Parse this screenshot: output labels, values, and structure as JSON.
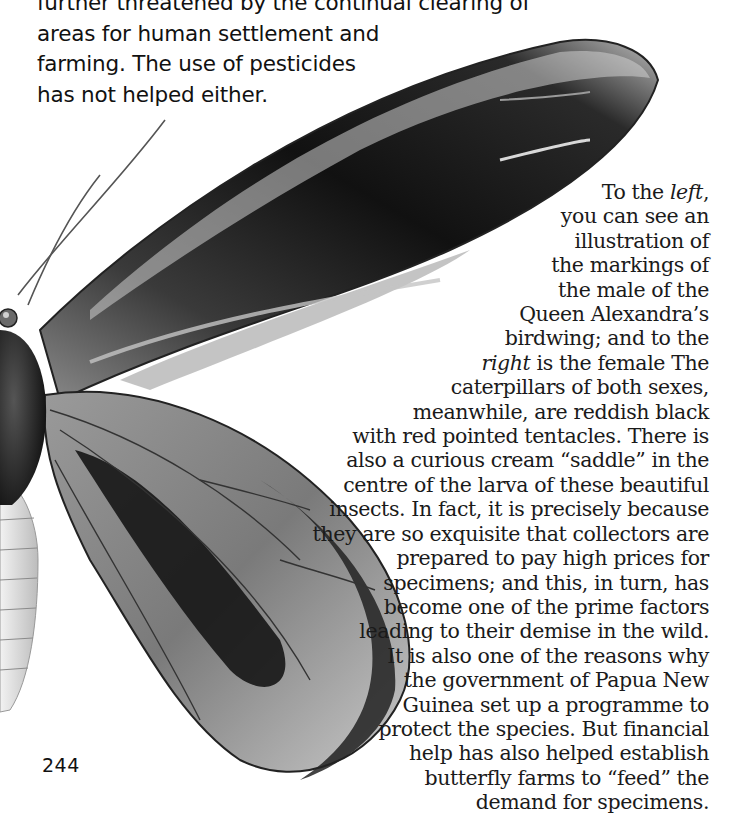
{
  "page": {
    "page_number": "244",
    "intro_paragraph": {
      "lines": [
        "further threatened by the continual clearing of",
        "areas for human settlement and",
        "farming. The use of pesticides",
        "has not helped either."
      ]
    },
    "illustration": {
      "subject": "Queen Alexandra's birdwing butterfly (male) — left wings, body and antennae",
      "style": "grayscale scanned drawing"
    },
    "body_paragraph": {
      "lines": [
        {
          "pre": "To the ",
          "em": "left",
          "post": ","
        },
        {
          "pre": "you can see an"
        },
        {
          "pre": "illustration of"
        },
        {
          "pre": "the markings of"
        },
        {
          "pre": "the male of the"
        },
        {
          "pre": "Queen Alexandra’s"
        },
        {
          "pre": "birdwing; and to the"
        },
        {
          "pre": "",
          "em": "right",
          "post": " is the female The"
        },
        {
          "pre": "caterpillars of both sexes,"
        },
        {
          "pre": "meanwhile, are reddish black"
        },
        {
          "pre": "with red pointed tentacles. There is"
        },
        {
          "pre": "also a curious cream “saddle” in the"
        },
        {
          "pre": "centre of the larva of these beautiful"
        },
        {
          "pre": "insects. In fact, it is precisely because"
        },
        {
          "pre": "they are so exquisite that collectors are"
        },
        {
          "pre": "prepared to pay high prices for"
        },
        {
          "pre": "specimens; and this, in turn, has"
        },
        {
          "pre": "become one of the prime factors"
        },
        {
          "pre": "leading to their demise in the wild."
        },
        {
          "pre": "It is also one of the reasons why"
        },
        {
          "pre": "the government of Papua New"
        },
        {
          "pre": "Guinea set up a programme to"
        },
        {
          "pre": "protect the species. But financial"
        },
        {
          "pre": "help has also helped establish"
        },
        {
          "pre": "butterfly farms to “feed” the"
        },
        {
          "pre": "demand for specimens."
        }
      ]
    }
  }
}
